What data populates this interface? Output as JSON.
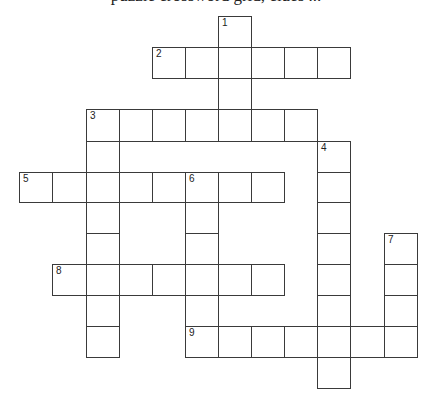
{
  "heading": {
    "text": "puzzle crossword grid, clues ...",
    "clipped": true
  },
  "grid": {
    "cell_width": 33,
    "cell_height": 31,
    "col_x": [
      19,
      52,
      86,
      119,
      152,
      185,
      218,
      251,
      284,
      317,
      350,
      384,
      417
    ],
    "row_y": [
      16,
      47,
      78,
      109,
      141,
      172,
      202,
      233,
      264,
      295,
      326,
      357,
      388
    ],
    "border_color": "#3a3a3a"
  },
  "entries": [
    {
      "number": "1",
      "direction": "down",
      "col": 6,
      "row": 0,
      "length": 4
    },
    {
      "number": "2",
      "direction": "across",
      "col": 4,
      "row": 1,
      "length": 6
    },
    {
      "number": "3",
      "direction": "across",
      "col": 2,
      "row": 3,
      "length": 7
    },
    {
      "number": "3",
      "direction": "down",
      "col": 2,
      "row": 3,
      "length": 8
    },
    {
      "number": "4",
      "direction": "down",
      "col": 9,
      "row": 4,
      "length": 8
    },
    {
      "number": "5",
      "direction": "across",
      "col": 0,
      "row": 5,
      "length": 8
    },
    {
      "number": "6",
      "direction": "down",
      "col": 5,
      "row": 5,
      "length": 6
    },
    {
      "number": "7",
      "direction": "down",
      "col": 11,
      "row": 7,
      "length": 4
    },
    {
      "number": "8",
      "direction": "across",
      "col": 1,
      "row": 8,
      "length": 7
    },
    {
      "number": "9",
      "direction": "across",
      "col": 5,
      "row": 10,
      "length": 7
    }
  ]
}
